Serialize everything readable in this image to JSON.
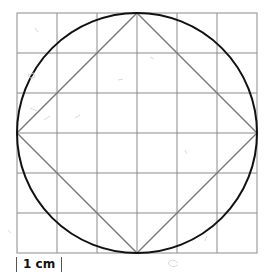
{
  "diagram": {
    "grid": {
      "rows": 6,
      "cols": 6,
      "cell_cm": 1
    },
    "shapes": [
      "circle",
      "inscribed-square"
    ],
    "colors": {
      "grid": "#8a8a8a",
      "circle": "#111111",
      "square": "#777777"
    }
  },
  "scale_bar": {
    "label": "1 cm"
  }
}
